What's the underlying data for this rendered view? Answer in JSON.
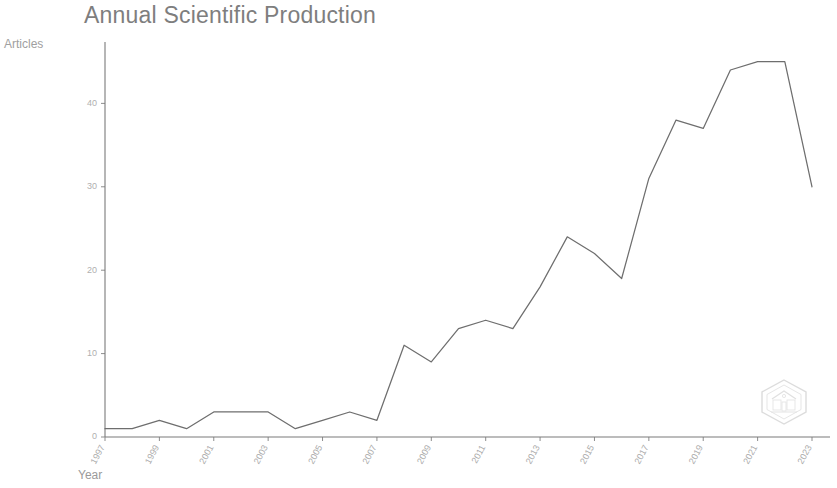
{
  "chart": {
    "title": "Annual Scientific Production",
    "ylabel": "Articles",
    "xlabel": "Year"
  },
  "watermark": {
    "name": "hexagon-emblem-watermark"
  },
  "chart_data": {
    "type": "line",
    "title": "Annual Scientific Production",
    "xlabel": "Year",
    "ylabel": "Articles",
    "xlim": [
      1997,
      2023
    ],
    "ylim": [
      0,
      47
    ],
    "grid": false,
    "legend": null,
    "x_tick_labels": [
      "1997",
      "1999",
      "2001",
      "2003",
      "2005",
      "2007",
      "2009",
      "2011",
      "2013",
      "2015",
      "2017",
      "2019",
      "2021",
      "2023"
    ],
    "y_tick_labels": [
      "0",
      "10",
      "20",
      "30",
      "40"
    ],
    "y_ticks": [
      0,
      10,
      20,
      30,
      40
    ],
    "x": [
      1997,
      1998,
      1999,
      2000,
      2001,
      2002,
      2003,
      2004,
      2005,
      2006,
      2007,
      2008,
      2009,
      2010,
      2011,
      2012,
      2013,
      2014,
      2015,
      2016,
      2017,
      2018,
      2019,
      2020,
      2021,
      2022,
      2023
    ],
    "values": [
      1,
      1,
      2,
      1,
      3,
      3,
      3,
      1,
      2,
      3,
      2,
      11,
      9,
      13,
      14,
      13,
      18,
      24,
      22,
      19,
      31,
      38,
      37,
      44,
      45,
      45,
      30
    ],
    "series": [
      {
        "name": "Articles",
        "values": [
          1,
          1,
          2,
          1,
          3,
          3,
          3,
          1,
          2,
          3,
          2,
          11,
          9,
          13,
          14,
          13,
          18,
          24,
          22,
          19,
          31,
          38,
          37,
          44,
          45,
          45,
          30
        ]
      }
    ]
  }
}
